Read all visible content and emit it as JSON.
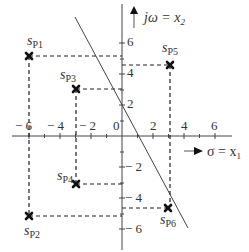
{
  "diagram": {
    "axes": {
      "x_label": "σ = x",
      "x_label_sub": "1",
      "y_label": "jω = x",
      "y_label_sub": "2",
      "x_ticks": [
        "− 6",
        "− 4",
        "− 2",
        "0",
        "2",
        "4",
        "6"
      ],
      "y_ticks": [
        "6",
        "4",
        "2",
        "− 2",
        "− 4",
        "− 6"
      ]
    },
    "poles": [
      {
        "id": "P1",
        "label": "s",
        "sub": "P1",
        "x": -6,
        "y": 5.2
      },
      {
        "id": "P2",
        "label": "s",
        "sub": "P2",
        "x": -6,
        "y": -5.2
      },
      {
        "id": "P3",
        "label": "s",
        "sub": "P3",
        "x": -3,
        "y": 3
      },
      {
        "id": "P4",
        "label": "s",
        "sub": "P4",
        "x": -3,
        "y": -3
      },
      {
        "id": "P5",
        "label": "s",
        "sub": "P5",
        "x": 3,
        "y": 4.6
      },
      {
        "id": "P6",
        "label": "s",
        "sub": "P6",
        "x": 3,
        "y": -4.6
      }
    ],
    "line": {
      "description": "separating line",
      "through": [
        [
          -3,
          7.5
        ],
        [
          4.3,
          -6
        ]
      ]
    }
  }
}
